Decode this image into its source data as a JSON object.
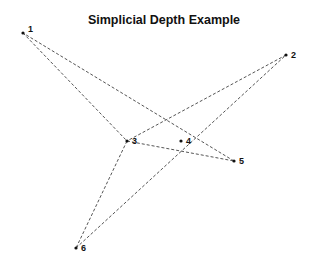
{
  "chart_data": {
    "type": "scatter",
    "title": "Simplicial Depth Example",
    "xlabel": "",
    "ylabel": "",
    "grid": false,
    "axes_visible": false,
    "points": [
      {
        "label": "1",
        "px": [
          23,
          33
        ]
      },
      {
        "label": "2",
        "px": [
          286,
          55
        ]
      },
      {
        "label": "3",
        "px": [
          127,
          141
        ]
      },
      {
        "label": "4",
        "px": [
          181,
          141
        ]
      },
      {
        "label": "5",
        "px": [
          234,
          161
        ]
      },
      {
        "label": "6",
        "px": [
          76,
          248
        ]
      }
    ],
    "triangles": [
      {
        "vertices": [
          "1",
          "3",
          "5"
        ]
      },
      {
        "vertices": [
          "2",
          "3",
          "6"
        ]
      }
    ],
    "line_style": "dashed",
    "line_color": "#555555",
    "point_color": "#111111"
  }
}
